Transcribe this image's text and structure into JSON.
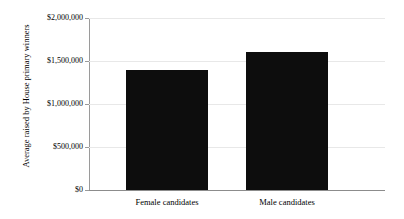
{
  "chart_data": {
    "type": "bar",
    "title": "",
    "xlabel": "",
    "ylabel": "Average raised by House primary winners",
    "categories": [
      "Female candidates",
      "Male candidates"
    ],
    "values": [
      1400000,
      1600000
    ],
    "ylim": [
      0,
      2000000
    ],
    "ytick_values": [
      0,
      500000,
      1000000,
      1500000,
      2000000
    ],
    "ytick_labels": [
      "$0",
      "$500,000",
      "$1,000,000",
      "$1,500,000",
      "$2,000,000"
    ],
    "grid": true,
    "legend": false,
    "bar_color": "#0d0d0d",
    "gridline_color": "#e8e8e8",
    "axis_color": "#8c8c8c",
    "background_color": "#ffffff"
  }
}
